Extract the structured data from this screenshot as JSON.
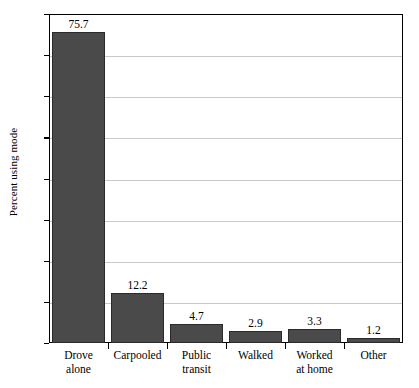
{
  "chart_data": {
    "type": "bar",
    "title": "",
    "xlabel": "",
    "ylabel": "Percent using mode",
    "ylim": [
      0,
      80
    ],
    "yticks": [
      0,
      10,
      20,
      30,
      40,
      50,
      60,
      70,
      80
    ],
    "ytick_labels": [
      "0",
      "10",
      "20",
      "30",
      "40",
      "50",
      "60",
      "70",
      "80"
    ],
    "grid": true,
    "legend": "none",
    "categories": [
      "Drove alone",
      "Carpooled",
      "Public transit",
      "Walked",
      "Worked at home",
      "Other"
    ],
    "category_lines": [
      [
        "Drove",
        "alone"
      ],
      [
        "Carpooled",
        ""
      ],
      [
        "Public",
        "transit"
      ],
      [
        "Walked",
        ""
      ],
      [
        "Worked",
        "at home"
      ],
      [
        "Other",
        ""
      ]
    ],
    "values": [
      75.7,
      12.2,
      4.7,
      2.9,
      3.3,
      1.2
    ],
    "value_labels": [
      "75.7",
      "12.2",
      "4.7",
      "2.9",
      "3.3",
      "1.2"
    ],
    "bar_color": "#4a4a4a",
    "bar_edge_color": "#2a2a2a",
    "grid_color": "#c9c9c9",
    "axis_color": "#000000"
  }
}
